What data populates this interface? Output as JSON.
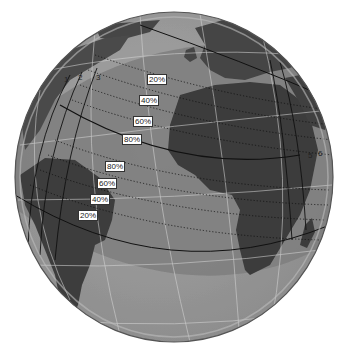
{
  "map": {
    "projection": "orthographic globe",
    "center": {
      "x": 174,
      "y": 177,
      "rx": 159,
      "ry": 165
    },
    "colors": {
      "background": "#ffffff",
      "ocean": "#9a9a9a",
      "ocean_band": "#7c7c7c",
      "land": "#444444",
      "land_band": "#3a3a3a",
      "graticule": "#d8d8d8",
      "path_line": "#111111",
      "rim_light": "#b8b8b8"
    },
    "path_markers": [
      "1",
      "2",
      "3",
      "5",
      "6"
    ],
    "percent_labels_north": [
      {
        "text": "20%",
        "x": 147,
        "y": 74
      },
      {
        "text": "40%",
        "x": 139,
        "y": 95
      },
      {
        "text": "60%",
        "x": 133,
        "y": 116
      },
      {
        "text": "80%",
        "x": 122,
        "y": 134
      }
    ],
    "percent_labels_south": [
      {
        "text": "80%",
        "x": 105,
        "y": 161
      },
      {
        "text": "60%",
        "x": 97,
        "y": 178
      },
      {
        "text": "40%",
        "x": 90,
        "y": 194
      },
      {
        "text": "20%",
        "x": 78,
        "y": 210
      }
    ]
  }
}
